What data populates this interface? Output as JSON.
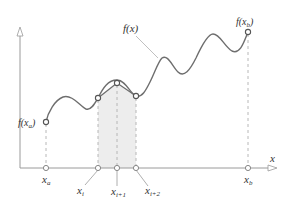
{
  "diagram": {
    "curve_label": "f(x)",
    "axis_x_label": "x",
    "start_value_label": {
      "base": "f(x",
      "sub": "a",
      "close": ")"
    },
    "end_value_label": {
      "base": "f(x",
      "sub": "b",
      "close": ")"
    },
    "ticks": [
      {
        "id": "xa",
        "base": "x",
        "sub": "a"
      },
      {
        "id": "xi",
        "base": "x",
        "sub": "i"
      },
      {
        "id": "xi1",
        "base": "x",
        "sub": "i+1"
      },
      {
        "id": "xi2",
        "base": "x",
        "sub": "i+2"
      },
      {
        "id": "xb",
        "base": "x",
        "sub": "b"
      }
    ],
    "colors": {
      "curve": "#6e6e6e",
      "axis": "#9a9a9a",
      "guide": "#b0b0b0",
      "shade": "#ededed",
      "marker_fill": "#ffffff",
      "marker_stroke": "#555555"
    }
  }
}
